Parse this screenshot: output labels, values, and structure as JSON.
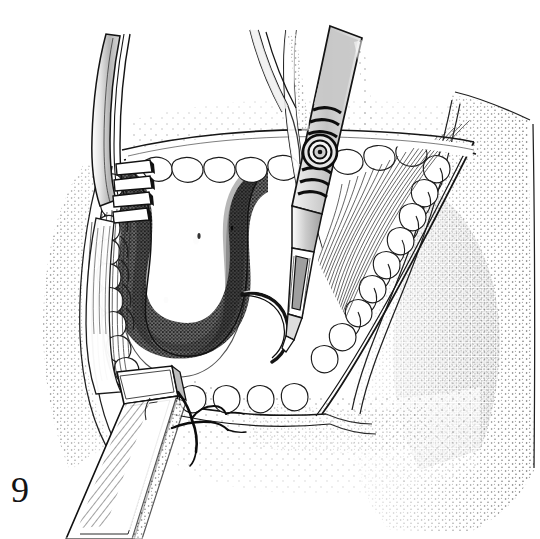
{
  "figure": {
    "number": "9",
    "caption_text": "",
    "medium": "pen-and-ink stipple line drawing",
    "subject": "surgical field with retracted wound, instruments and suture",
    "background_color": "#ffffff",
    "ink_color": "#1a1a1a",
    "stipple_color": "#3b3b3b",
    "metal_fill_color": "#c9c9c9",
    "cavity_fill_color": "#5a5a5a",
    "width": 540,
    "height": 539
  },
  "elements": {
    "skin_surface": {
      "name": "skin-surface",
      "label": "Stippled skin surface"
    },
    "wound_cavity": {
      "name": "wound-cavity",
      "label": "Deep dark stippled wound cavity"
    },
    "fat_lobules_left": {
      "name": "fat-lobules-left",
      "label": "Subcutaneous fat lobules, left wound edge"
    },
    "fat_lobules_right": {
      "name": "fat-lobules-right",
      "label": "Subcutaneous fat lobules, right wound edge"
    },
    "muscle_fibers": {
      "name": "muscle-fibers",
      "label": "Radiating muscle fiber striations"
    },
    "rake_retractor": {
      "name": "rake-retractor",
      "label": "Toothed rake retractor, upper left"
    },
    "ribbon_retractor": {
      "name": "ribbon-retractor",
      "label": "Flat ribbon retractor blade, lower left"
    },
    "forceps": {
      "name": "forceps-instrument",
      "label": "Ringed-grip forceps with curved tip"
    },
    "scissors_shaft": {
      "name": "scissors-shaft",
      "label": "Second instrument shaft, upper centre"
    },
    "suture_knot": {
      "name": "suture-knot",
      "label": "Tied suture with thread tails"
    },
    "hook_probe": {
      "name": "hook-probe",
      "label": "Curved hook / probe in cavity"
    }
  }
}
